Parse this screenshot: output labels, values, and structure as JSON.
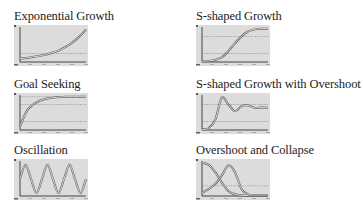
{
  "colors": {
    "background": "#ffffff",
    "plot_bg": "#dcdcdc",
    "axis": "#444444",
    "curve": "#ffffff",
    "curve_outline": "#555555",
    "gridline": "#888888",
    "title_text": "#222222"
  },
  "panels": [
    {
      "id": "exponential-growth",
      "title": "Exponential Growth",
      "column": 0,
      "row": 0
    },
    {
      "id": "s-shaped-growth",
      "title": "S-shaped Growth",
      "column": 1,
      "row": 0
    },
    {
      "id": "goal-seeking",
      "title": "Goal Seeking",
      "column": 0,
      "row": 1
    },
    {
      "id": "s-shaped-growth-with-overshoot",
      "title": "S-shaped Growth with Overshoot",
      "column": 1,
      "row": 1
    },
    {
      "id": "oscillation",
      "title": "Oscillation",
      "column": 0,
      "row": 2
    },
    {
      "id": "overshoot-and-collapse",
      "title": "Overshoot and Collapse",
      "column": 1,
      "row": 2
    }
  ],
  "chart_data": [
    {
      "type": "line",
      "title": "Exponential Growth",
      "xlabel": "",
      "ylabel": "",
      "grid": "dotted horizontal reference lines",
      "x": [
        0,
        1,
        2,
        3,
        4,
        5,
        6,
        7,
        8,
        9,
        10
      ],
      "series": [
        {
          "name": "behavior",
          "values": [
            0.1,
            0.12,
            0.15,
            0.18,
            0.22,
            0.28,
            0.35,
            0.45,
            0.58,
            0.75,
            0.95
          ]
        }
      ],
      "reference_lines": [
        0.25
      ],
      "ylim": [
        0,
        1
      ]
    },
    {
      "type": "line",
      "title": "S-shaped Growth",
      "xlabel": "",
      "ylabel": "",
      "grid": "dotted horizontal reference lines",
      "x": [
        0,
        1,
        2,
        3,
        4,
        5,
        6,
        7,
        8,
        9,
        10
      ],
      "series": [
        {
          "name": "behavior",
          "values": [
            0.02,
            0.03,
            0.06,
            0.14,
            0.32,
            0.55,
            0.76,
            0.9,
            0.96,
            0.98,
            0.98
          ]
        }
      ],
      "reference_lines": [
        0.25,
        0.75
      ],
      "ylim": [
        0,
        1
      ]
    },
    {
      "type": "line",
      "title": "Goal Seeking",
      "xlabel": "",
      "ylabel": "",
      "grid": "dotted horizontal reference lines",
      "x": [
        0,
        1,
        2,
        3,
        4,
        5,
        6,
        7,
        8,
        9,
        10
      ],
      "series": [
        {
          "name": "behavior",
          "values": [
            0.1,
            0.55,
            0.75,
            0.86,
            0.92,
            0.95,
            0.97,
            0.98,
            0.98,
            0.98,
            0.98
          ]
        }
      ],
      "reference_lines": [
        0.25,
        0.75,
        0.98
      ],
      "ylim": [
        0,
        1
      ]
    },
    {
      "type": "line",
      "title": "S-shaped Growth with Overshoot",
      "xlabel": "",
      "ylabel": "",
      "grid": "dotted horizontal reference lines",
      "x": [
        0,
        1,
        2,
        3,
        4,
        5,
        6,
        7,
        8,
        9,
        10
      ],
      "series": [
        {
          "name": "behavior",
          "values": [
            0.02,
            0.05,
            0.3,
            0.95,
            0.75,
            0.55,
            0.7,
            0.72,
            0.65,
            0.66,
            0.65
          ]
        }
      ],
      "reference_lines": [
        0.25,
        0.75
      ],
      "ylim": [
        0,
        1
      ]
    },
    {
      "type": "line",
      "title": "Oscillation",
      "xlabel": "",
      "ylabel": "",
      "grid": "none",
      "x": [
        0,
        1,
        2,
        3,
        4,
        5,
        6,
        7,
        8,
        9,
        10,
        11,
        12
      ],
      "series": [
        {
          "name": "behavior",
          "values": [
            0.5,
            0.92,
            0.5,
            0.08,
            0.5,
            0.92,
            0.5,
            0.08,
            0.5,
            0.92,
            0.5,
            0.08,
            0.5
          ]
        }
      ],
      "ylim": [
        0,
        1
      ]
    },
    {
      "type": "line",
      "title": "Overshoot and Collapse",
      "xlabel": "",
      "ylabel": "",
      "grid": "dotted horizontal reference line",
      "x": [
        0,
        1,
        2,
        3,
        4,
        5,
        6,
        7,
        8,
        9,
        10
      ],
      "series": [
        {
          "name": "resource",
          "values": [
            0.98,
            0.92,
            0.7,
            0.4,
            0.15,
            0.05,
            0.02,
            0.01,
            0.01,
            0.01,
            0.01
          ]
        },
        {
          "name": "state",
          "values": [
            0.1,
            0.2,
            0.35,
            0.6,
            0.9,
            0.7,
            0.2,
            0.05,
            0.03,
            0.03,
            0.03
          ]
        }
      ],
      "reference_lines": [
        0.3
      ],
      "ylim": [
        0,
        1
      ]
    }
  ]
}
